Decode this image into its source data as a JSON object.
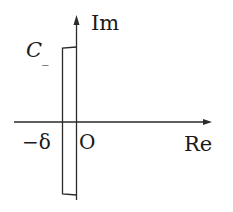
{
  "diagram": {
    "type": "complex-plane-contour",
    "axes": {
      "x_label": "Re",
      "y_label": "Im",
      "origin_label": "O"
    },
    "contour": {
      "label_main": "C",
      "label_sub": "_",
      "shape": "rectangle-left-of-imaginary-axis"
    },
    "marks": {
      "neg_delta": "−δ"
    },
    "colors": {
      "stroke": "#2a2a2a",
      "background": "#ffffff"
    }
  }
}
